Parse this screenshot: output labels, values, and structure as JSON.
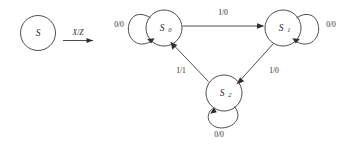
{
  "diagram": {
    "type": "state-transition-diagram",
    "title": "",
    "notation_key": {
      "state_symbol": "S",
      "transition_label": "X/Z"
    },
    "states": [
      {
        "id": "S0",
        "label": "S",
        "subscript": "0",
        "cx": 164,
        "cy": 28,
        "r": 18
      },
      {
        "id": "S1",
        "label": "S",
        "subscript": "1",
        "cx": 283,
        "cy": 28,
        "r": 18
      },
      {
        "id": "S2",
        "label": "S",
        "subscript": "2",
        "cx": 224,
        "cy": 93,
        "r": 18
      }
    ],
    "self_loops": [
      {
        "state": "S0",
        "label": "0/0",
        "side": "left",
        "label_x": 119,
        "label_y": 25
      },
      {
        "state": "S1",
        "label": "0/0",
        "side": "right",
        "label_x": 328,
        "label_y": 25
      },
      {
        "state": "S2",
        "label": "0/0",
        "side": "bottom",
        "label_x": 219,
        "label_y": 133
      }
    ],
    "transitions": [
      {
        "from": "S0",
        "to": "S1",
        "label": "1/0",
        "label_x": 223,
        "label_y": 13
      },
      {
        "from": "S1",
        "to": "S2",
        "label": "1/0",
        "label_x": 272,
        "label_y": 71
      },
      {
        "from": "S2",
        "to": "S0",
        "label": "1/1",
        "label_x": 182,
        "label_y": 71
      }
    ],
    "colors": {
      "stroke": "#3a3a3a",
      "text": "#2b2b2b",
      "background": "#ffffff"
    }
  }
}
